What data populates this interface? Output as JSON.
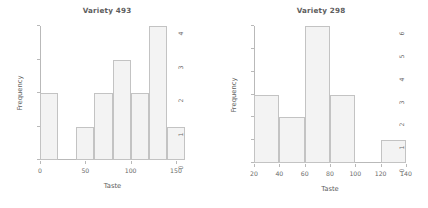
{
  "figure": {
    "background": "#ffffff",
    "bar_fill": "#f3f3f3",
    "bar_edge": "#c3c3c3",
    "axis_color": "#b9b9b9",
    "text_color": "#5d5d5d"
  },
  "panels": [
    {
      "title": "Variety 493",
      "xlabel": "Taste",
      "ylabel": "Frequency",
      "x_ticks": [
        "0",
        "50",
        "100",
        "150"
      ],
      "y_ticks": [
        "0",
        "1",
        "2",
        "3",
        "4"
      ]
    },
    {
      "title": "Variety 298",
      "xlabel": "Taste",
      "ylabel": "Frequency",
      "x_ticks": [
        "20",
        "40",
        "60",
        "80",
        "100",
        "120",
        "140"
      ],
      "y_ticks": [
        "0",
        "1",
        "2",
        "3",
        "4",
        "5",
        "6"
      ]
    }
  ],
  "chart_data": [
    {
      "type": "bar",
      "title": "Variety 493",
      "xlabel": "Taste",
      "ylabel": "Frequency",
      "grid": false,
      "legend": "none",
      "xlim": [
        0,
        160
      ],
      "ylim": [
        0,
        4
      ],
      "bin_width": 20,
      "bin_edges": [
        0,
        20,
        40,
        60,
        80,
        100,
        120,
        140,
        160
      ],
      "categories": [
        "0-20",
        "20-40",
        "40-60",
        "60-80",
        "80-100",
        "100-120",
        "120-140",
        "140-160"
      ],
      "values": [
        2,
        0,
        1,
        2,
        3,
        2,
        4,
        1
      ],
      "x_tick_values": [
        0,
        50,
        100,
        150
      ],
      "y_tick_values": [
        0,
        1,
        2,
        3,
        4
      ]
    },
    {
      "type": "bar",
      "title": "Variety 298",
      "xlabel": "Taste",
      "ylabel": "Frequency",
      "grid": false,
      "legend": "none",
      "xlim": [
        20,
        140
      ],
      "ylim": [
        0,
        6
      ],
      "bin_width": 20,
      "bin_edges": [
        20,
        40,
        60,
        80,
        100,
        120,
        140
      ],
      "categories": [
        "20-40",
        "40-60",
        "60-80",
        "80-100",
        "100-120",
        "120-140"
      ],
      "values": [
        3,
        2,
        6,
        3,
        0,
        1
      ],
      "x_tick_values": [
        20,
        40,
        60,
        80,
        100,
        120,
        140
      ],
      "y_tick_values": [
        0,
        1,
        2,
        3,
        4,
        5,
        6
      ]
    }
  ]
}
